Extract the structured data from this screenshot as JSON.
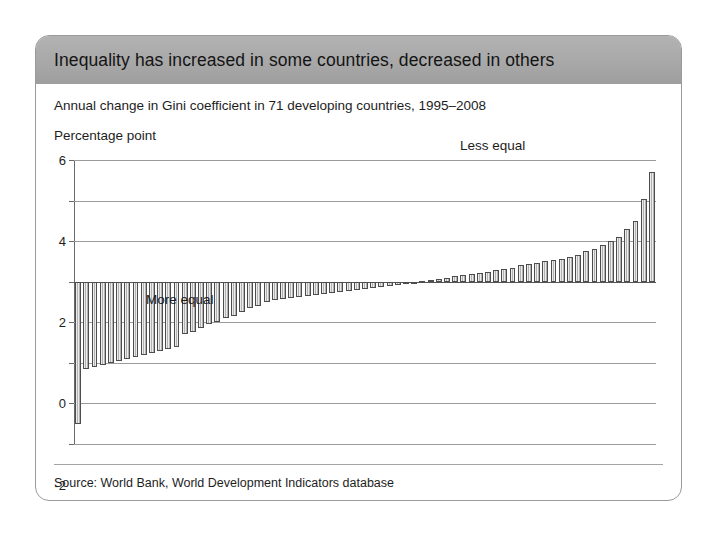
{
  "figure": {
    "title": "Inequality has increased in some countries, decreased in others",
    "subtitle": "Annual change in Gini coefficient in 71 developing countries, 1995–2008",
    "unit_label": "Percentage point",
    "source": "Source: World Bank, World Development Indicators database",
    "header_color": "#a8a8a8",
    "bar_fill_color": "#c9c9c9",
    "bar_edge_color": "#4d4d4d",
    "grid_color": "#9b9b9b"
  },
  "annotations": [
    {
      "id": "less-equal",
      "text": "Less equal"
    },
    {
      "id": "more-equal",
      "text": "More equal"
    }
  ],
  "chart_data": {
    "type": "bar",
    "title": "Inequality has increased in some countries, decreased in others",
    "subtitle": "Annual change in Gini coefficient in 71 developing countries, 1995–2008",
    "xlabel": "",
    "ylabel": "Percentage point",
    "ylim": [
      -8,
      6
    ],
    "yticks": [
      6,
      4,
      2,
      0,
      -2,
      -4,
      -6,
      -8
    ],
    "ytick_labels": [
      "6",
      "4",
      "2",
      "0",
      "-2",
      "-4",
      "-6",
      "-8"
    ],
    "grid": true,
    "legend": "none",
    "n_categories": 71,
    "categories": [
      "1",
      "2",
      "3",
      "4",
      "5",
      "6",
      "7",
      "8",
      "9",
      "10",
      "11",
      "12",
      "13",
      "14",
      "15",
      "16",
      "17",
      "18",
      "19",
      "20",
      "21",
      "22",
      "23",
      "24",
      "25",
      "26",
      "27",
      "28",
      "29",
      "30",
      "31",
      "32",
      "33",
      "34",
      "35",
      "36",
      "37",
      "38",
      "39",
      "40",
      "41",
      "42",
      "43",
      "44",
      "45",
      "46",
      "47",
      "48",
      "49",
      "50",
      "51",
      "52",
      "53",
      "54",
      "55",
      "56",
      "57",
      "58",
      "59",
      "60",
      "61",
      "62",
      "63",
      "64",
      "65",
      "66",
      "67",
      "68",
      "69",
      "70",
      "71"
    ],
    "values": [
      -7.0,
      -4.3,
      -4.2,
      -4.1,
      -4.0,
      -3.9,
      -3.8,
      -3.7,
      -3.6,
      -3.5,
      -3.4,
      -3.3,
      -3.2,
      -2.6,
      -2.5,
      -2.3,
      -2.1,
      -2.0,
      -1.8,
      -1.7,
      -1.5,
      -1.3,
      -1.2,
      -1.0,
      -0.9,
      -0.85,
      -0.8,
      -0.75,
      -0.7,
      -0.65,
      -0.6,
      -0.55,
      -0.5,
      -0.45,
      -0.4,
      -0.35,
      -0.3,
      -0.25,
      -0.2,
      -0.15,
      -0.1,
      -0.05,
      0.05,
      0.1,
      0.15,
      0.2,
      0.3,
      0.35,
      0.4,
      0.45,
      0.5,
      0.6,
      0.65,
      0.7,
      0.8,
      0.85,
      0.9,
      1.0,
      1.05,
      1.1,
      1.2,
      1.3,
      1.5,
      1.6,
      1.8,
      2.0,
      2.2,
      2.6,
      3.0,
      4.1,
      5.4
    ],
    "annotations": [
      {
        "text": "Less equal",
        "x": 58,
        "y": 3.2
      },
      {
        "text": "More equal",
        "x": 12,
        "y": -5.0
      }
    ],
    "source": "Source: World Bank, World Development Indicators database"
  }
}
